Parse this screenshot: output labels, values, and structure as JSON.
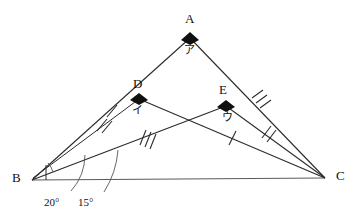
{
  "figure": {
    "type": "geometry-diagram",
    "stroke_color": "#2b2b2b",
    "text_color": "#111111",
    "background": "#ffffff",
    "width": 360,
    "height": 221
  },
  "vertices": [
    {
      "name": "A",
      "label": "A",
      "x": 190,
      "y": 38,
      "label_x": 185,
      "label_y": 13,
      "marker": "diamond"
    },
    {
      "name": "B",
      "label": "B",
      "x": 32,
      "y": 180,
      "label_x": 13,
      "label_y": 172,
      "marker": "none"
    },
    {
      "name": "C",
      "label": "C",
      "x": 325,
      "y": 178,
      "label_x": 336,
      "label_y": 170,
      "marker": "none"
    },
    {
      "name": "D",
      "label": "D",
      "x": 139,
      "y": 99,
      "label_x": 134,
      "label_y": 78,
      "marker": "diamond"
    },
    {
      "name": "E",
      "label": "E",
      "x": 226,
      "y": 106,
      "label_x": 219,
      "label_y": 84,
      "marker": "diamond"
    }
  ],
  "angle_annotations": [
    {
      "name": "angle-20",
      "label": "20°",
      "value": 20,
      "label_x": 45,
      "label_y": 198
    },
    {
      "name": "angle-15",
      "label": "15°",
      "value": 15,
      "label_x": 79,
      "label_y": 198
    }
  ],
  "kana_labels": [
    {
      "name": "kana-a",
      "label": "ア",
      "at_vertex": "A",
      "label_x": 185,
      "label_y": 44
    },
    {
      "name": "kana-i",
      "label": "イ",
      "at_vertex": "D",
      "label_x": 133,
      "label_y": 104
    },
    {
      "name": "kana-u",
      "label": "ウ",
      "at_vertex": "E",
      "label_x": 223,
      "label_y": 111
    }
  ],
  "segments": [
    {
      "name": "segment-b-a",
      "from": "B",
      "to": "A",
      "ticks": 1,
      "tick_t": 0.5
    },
    {
      "name": "segment-a-c",
      "from": "A",
      "to": "C",
      "ticks": 3,
      "tick_t": 0.5
    },
    {
      "name": "segment-b-c",
      "from": "B",
      "to": "C",
      "ticks": 0,
      "tick_t": 0.5
    },
    {
      "name": "segment-b-e",
      "from": "B",
      "to": "E",
      "ticks": 2,
      "tick_t": 0.38
    },
    {
      "name": "segment-b-e-outer",
      "from": "B",
      "to": "E",
      "ticks": 3,
      "tick_t": 0.6
    },
    {
      "name": "segment-d-c",
      "from": "D",
      "to": "C",
      "ticks": 1,
      "tick_t": 0.52
    },
    {
      "name": "segment-e-c",
      "from": "E",
      "to": "C",
      "ticks": 2,
      "tick_t": 0.45
    }
  ],
  "tick_marks": [
    {
      "name": "tick-bd-single",
      "on": "segment-b-a",
      "count": 1
    },
    {
      "name": "tick-be-double",
      "on": "segment-b-e",
      "count": 2
    },
    {
      "name": "tick-be-triple",
      "on": "segment-b-e-outer",
      "count": 3
    },
    {
      "name": "tick-dc-single",
      "on": "segment-d-c",
      "count": 1
    },
    {
      "name": "tick-ec-double",
      "on": "segment-e-c",
      "count": 2
    },
    {
      "name": "tick-ac-triple",
      "on": "segment-a-c",
      "count": 3
    }
  ]
}
